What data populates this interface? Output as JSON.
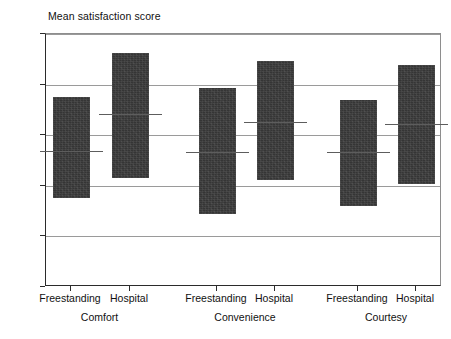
{
  "chart_data": {
    "type": "bar",
    "title": "",
    "ylabel": "Mean satisfaction score",
    "xlabel": "",
    "ylim": [
      0,
      2.5
    ],
    "ytick_labels": [
      "0",
      "0.5",
      "1",
      "1.5",
      "2",
      "2.5"
    ],
    "ytick_values": [
      0,
      0.5,
      1,
      1.5,
      2,
      2.5
    ],
    "grid": true,
    "legend": "none",
    "groups": [
      "Comfort",
      "Convenience",
      "Courtesy"
    ],
    "categories": [
      "Freestanding",
      "Hospital",
      "Freestanding",
      "Hospital",
      "Freestanding",
      "Hospital"
    ],
    "bars": [
      {
        "group": "Comfort",
        "category": "Freestanding",
        "low": 0.88,
        "high": 1.88,
        "median": 1.34
      },
      {
        "group": "Comfort",
        "category": "Hospital",
        "low": 1.08,
        "high": 2.31,
        "median": 1.71
      },
      {
        "group": "Convenience",
        "category": "Freestanding",
        "low": 0.72,
        "high": 1.97,
        "median": 1.33
      },
      {
        "group": "Convenience",
        "category": "Hospital",
        "low": 1.06,
        "high": 2.23,
        "median": 1.63
      },
      {
        "group": "Courtesy",
        "category": "Freestanding",
        "low": 0.8,
        "high": 1.85,
        "median": 1.33
      },
      {
        "group": "Courtesy",
        "category": "Hospital",
        "low": 1.02,
        "high": 2.19,
        "median": 1.61
      }
    ],
    "series": [
      {
        "name": "low",
        "values": [
          0.88,
          1.08,
          0.72,
          1.06,
          0.8,
          1.02
        ]
      },
      {
        "name": "high",
        "values": [
          1.88,
          2.31,
          1.97,
          2.23,
          1.85,
          2.19
        ]
      },
      {
        "name": "median",
        "values": [
          1.34,
          1.71,
          1.33,
          1.63,
          1.33,
          1.61
        ]
      }
    ],
    "colors": {
      "bar_fill": "#353535",
      "median_line": "#5d5d5d",
      "gridline": "#9a9a9a",
      "axis": "#2b2b2b",
      "text": "#111111",
      "background": "#ffffff"
    }
  }
}
